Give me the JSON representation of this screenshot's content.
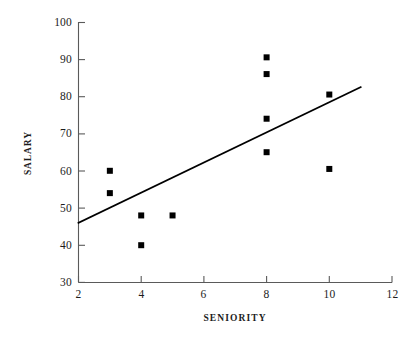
{
  "chart_data": {
    "type": "scatter",
    "title": "",
    "xlabel": "SENIORITY",
    "ylabel": "SALARY",
    "xlim": [
      2,
      12
    ],
    "ylim": [
      30,
      100
    ],
    "xticks": [
      2,
      4,
      6,
      8,
      10,
      12
    ],
    "yticks": [
      30,
      40,
      50,
      60,
      70,
      80,
      90,
      100
    ],
    "xtick_labels": [
      "2",
      "4",
      "6",
      "8",
      "10",
      "12"
    ],
    "ytick_labels": [
      "30",
      "40",
      "50",
      "60",
      "70",
      "80",
      "90",
      "100"
    ],
    "grid": false,
    "legend": false,
    "marker": "square",
    "marker_color": "#000000",
    "marker_size": 6,
    "points": [
      {
        "x": 3,
        "y": 60.0
      },
      {
        "x": 3,
        "y": 54.0
      },
      {
        "x": 4,
        "y": 48.0
      },
      {
        "x": 4,
        "y": 40.0
      },
      {
        "x": 5,
        "y": 48.0
      },
      {
        "x": 8,
        "y": 90.5
      },
      {
        "x": 8,
        "y": 86.0
      },
      {
        "x": 8,
        "y": 74.0
      },
      {
        "x": 8,
        "y": 65.0
      },
      {
        "x": 10,
        "y": 80.5
      },
      {
        "x": 10,
        "y": 60.5
      }
    ],
    "trendline": {
      "name": "regression-line",
      "color": "#000000",
      "x_start": 2,
      "y_start": 46.0,
      "x_end": 11,
      "y_end": 82.5
    },
    "axis_color": "#4c4c4c"
  }
}
